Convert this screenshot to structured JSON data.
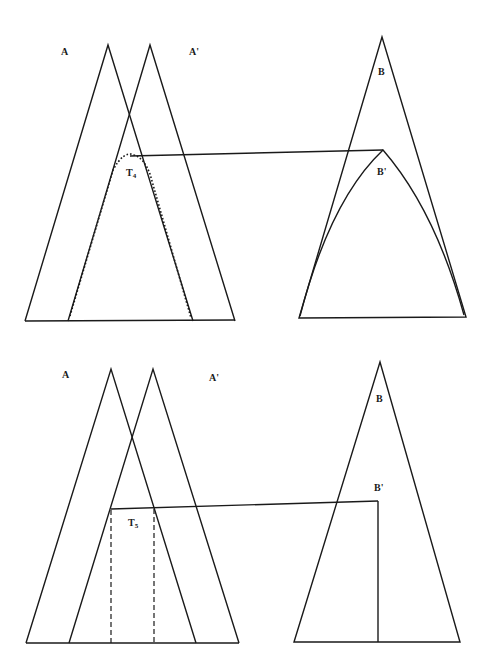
{
  "panels": [
    {
      "id": "top",
      "labels": {
        "A": "A",
        "A_prime": "A'",
        "B": "B",
        "B_prime": "B'",
        "T_main": "T",
        "T_sub": "4"
      },
      "description": "Overlapping triangles A and A' with dotted curved region T4 connected by a line to curved region B' inside triangle B"
    },
    {
      "id": "bottom",
      "labels": {
        "A": "A",
        "A_prime": "A'",
        "B": "B",
        "B_prime": "B'",
        "T_main": "T",
        "T_sub": "5"
      },
      "description": "Overlapping triangles A and A' with dashed rectangular region T5 connected by a line to a vertical segment B' inside triangle B"
    }
  ]
}
